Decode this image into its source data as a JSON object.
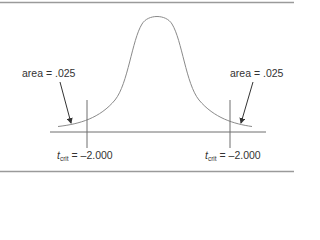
{
  "figure": {
    "type": "t-distribution-two-tailed-critical-regions",
    "colors": {
      "curve": "#8a8a8a",
      "axis": "#6e6e6e",
      "border": "#9a9a9a",
      "text": "#333333",
      "arrow": "#333333"
    },
    "left_tail": {
      "area_label": "area = .025",
      "tcrit_symbol": "t",
      "tcrit_subscript": "crit",
      "tcrit_value": "= –2.000"
    },
    "right_tail": {
      "area_label": "area = .025",
      "tcrit_symbol": "t",
      "tcrit_subscript": "crit",
      "tcrit_value": "= –2.000"
    }
  }
}
